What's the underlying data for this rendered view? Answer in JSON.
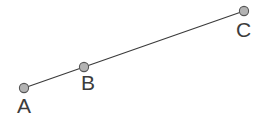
{
  "figure": {
    "type": "geometry-diagram",
    "width": 262,
    "height": 120,
    "background_color": "#ffffff",
    "line": {
      "name": "segment-AC",
      "color": "#3a3a3a",
      "width": 1.1,
      "from": {
        "x": 24,
        "y": 88
      },
      "to": {
        "x": 244,
        "y": 11
      }
    },
    "point_style": {
      "radius": 4.6,
      "fill": "#b3b3b3",
      "stroke": "#555555",
      "stroke_width": 1.1
    },
    "points": [
      {
        "id": "A",
        "label": "A",
        "x": 24,
        "y": 88
      },
      {
        "id": "B",
        "label": "B",
        "x": 84,
        "y": 67
      },
      {
        "id": "C",
        "label": "C",
        "x": 244,
        "y": 11
      }
    ]
  }
}
